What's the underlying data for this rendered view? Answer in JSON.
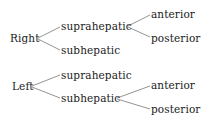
{
  "diagram": {
    "type": "tree",
    "trees": [
      {
        "root": "Right",
        "children": [
          {
            "label": "suprahepatic",
            "children": [
              {
                "label": "anterior"
              },
              {
                "label": "posterior"
              }
            ]
          },
          {
            "label": "subhepatic",
            "children": []
          }
        ]
      },
      {
        "root": "Left",
        "children": [
          {
            "label": "suprahepatic",
            "children": []
          },
          {
            "label": "subhepatic",
            "children": [
              {
                "label": "anterior"
              },
              {
                "label": "posterior"
              }
            ]
          }
        ]
      }
    ],
    "edge_color": "#777777",
    "text_color": "#1a1a1a"
  }
}
